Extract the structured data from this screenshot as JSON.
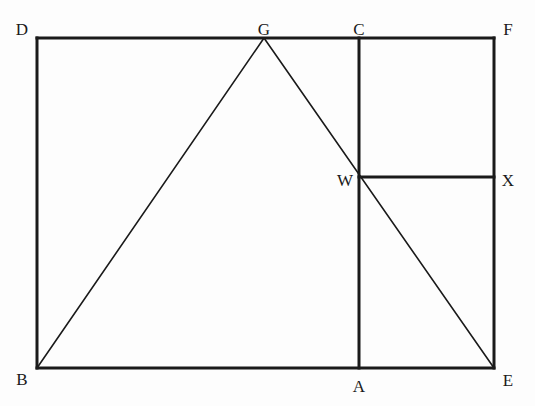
{
  "figure": {
    "background_color": "#fdfdfd",
    "stroke_color": "#1a1a1a",
    "thick_stroke_width": 3,
    "thin_stroke_width": 1.6,
    "canvas": {
      "width": 535,
      "height": 406
    }
  },
  "points": {
    "B": {
      "label": "B",
      "x": 37,
      "y": 368,
      "label_x": 22,
      "label_y": 379
    },
    "D": {
      "label": "D",
      "x": 37,
      "y": 38,
      "label_x": 22,
      "label_y": 29
    },
    "G": {
      "label": "G",
      "x": 264,
      "y": 38,
      "label_x": 264,
      "label_y": 29
    },
    "C": {
      "label": "C",
      "x": 359,
      "y": 38,
      "label_x": 359,
      "label_y": 29
    },
    "F": {
      "label": "F",
      "x": 494,
      "y": 38,
      "label_x": 508,
      "label_y": 29
    },
    "W": {
      "label": "W",
      "x": 359,
      "y": 177,
      "label_x": 345,
      "label_y": 180
    },
    "X": {
      "label": "X",
      "x": 494,
      "y": 177,
      "label_x": 508,
      "label_y": 180
    },
    "A": {
      "label": "A",
      "x": 359,
      "y": 368,
      "label_x": 359,
      "label_y": 386
    },
    "E": {
      "label": "E",
      "x": 494,
      "y": 368,
      "label_x": 508,
      "label_y": 380
    }
  },
  "segments": [
    {
      "name": "side-DF-top",
      "from": "D",
      "to": "F",
      "x1": 37,
      "y1": 38,
      "x2": 494,
      "y2": 38,
      "weight": "thick"
    },
    {
      "name": "side-BD-left",
      "from": "B",
      "to": "D",
      "x1": 37,
      "y1": 38,
      "x2": 37,
      "y2": 368,
      "weight": "thick"
    },
    {
      "name": "side-BE-bottom",
      "from": "B",
      "to": "E",
      "x1": 37,
      "y1": 368,
      "x2": 494,
      "y2": 368,
      "weight": "thick"
    },
    {
      "name": "side-FE-right",
      "from": "F",
      "to": "E",
      "x1": 494,
      "y1": 38,
      "x2": 494,
      "y2": 368,
      "weight": "thick"
    },
    {
      "name": "segment-CA-vertical",
      "from": "C",
      "to": "A",
      "x1": 359,
      "y1": 38,
      "x2": 359,
      "y2": 368,
      "weight": "thick"
    },
    {
      "name": "segment-WX-horizontal",
      "from": "W",
      "to": "X",
      "x1": 359,
      "y1": 177,
      "x2": 494,
      "y2": 177,
      "weight": "thick"
    },
    {
      "name": "diagonal-BG",
      "from": "B",
      "to": "G",
      "x1": 37,
      "y1": 368,
      "x2": 264,
      "y2": 38,
      "weight": "thin"
    },
    {
      "name": "diagonal-GE",
      "from": "G",
      "to": "E",
      "x1": 264,
      "y1": 38,
      "x2": 494,
      "y2": 368,
      "weight": "thin"
    }
  ]
}
